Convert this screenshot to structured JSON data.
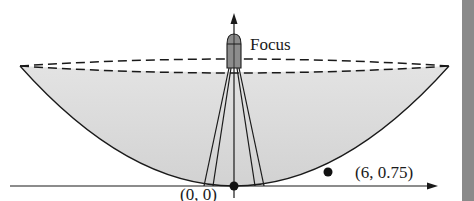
{
  "diagram": {
    "labels": {
      "focus": "Focus",
      "vertex_point": "(0, 0)",
      "curve_point": "(6, 0.75)"
    },
    "points": [
      {
        "name": "vertex",
        "x": 0,
        "y": 0
      },
      {
        "name": "point-on-parabola",
        "x": 6,
        "y": 0.75
      }
    ],
    "colors": {
      "dish_fill": "#d9d9d9",
      "receiver_fill": "#8c8c8c",
      "stroke": "#1a1a1a",
      "edge_bar": "#8a8a8a"
    }
  }
}
